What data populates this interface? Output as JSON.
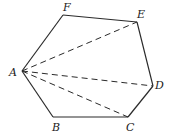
{
  "diagram": {
    "type": "hexagon-with-diagonals",
    "vertices": [
      {
        "name": "A",
        "x": 22,
        "y": 71,
        "label_x": 9,
        "label_y": 76
      },
      {
        "name": "B",
        "x": 53,
        "y": 117,
        "label_x": 52,
        "label_y": 131
      },
      {
        "name": "C",
        "x": 128,
        "y": 117,
        "label_x": 126,
        "label_y": 131
      },
      {
        "name": "D",
        "x": 153,
        "y": 86,
        "label_x": 155,
        "label_y": 89
      },
      {
        "name": "E",
        "x": 137,
        "y": 22,
        "label_x": 137,
        "label_y": 18
      },
      {
        "name": "F",
        "x": 63,
        "y": 15,
        "label_x": 63,
        "label_y": 11
      }
    ],
    "labels": {
      "A": "A",
      "B": "B",
      "C": "C",
      "D": "D",
      "E": "E",
      "F": "F"
    },
    "edges": [
      [
        "A",
        "B"
      ],
      [
        "B",
        "C"
      ],
      [
        "C",
        "D"
      ],
      [
        "D",
        "E"
      ],
      [
        "E",
        "F"
      ],
      [
        "F",
        "A"
      ]
    ],
    "diagonals": [
      [
        "A",
        "E"
      ],
      [
        "A",
        "D"
      ],
      [
        "A",
        "C"
      ]
    ],
    "colors": {
      "stroke": "#2a2a2a",
      "background": "#ffffff"
    }
  }
}
